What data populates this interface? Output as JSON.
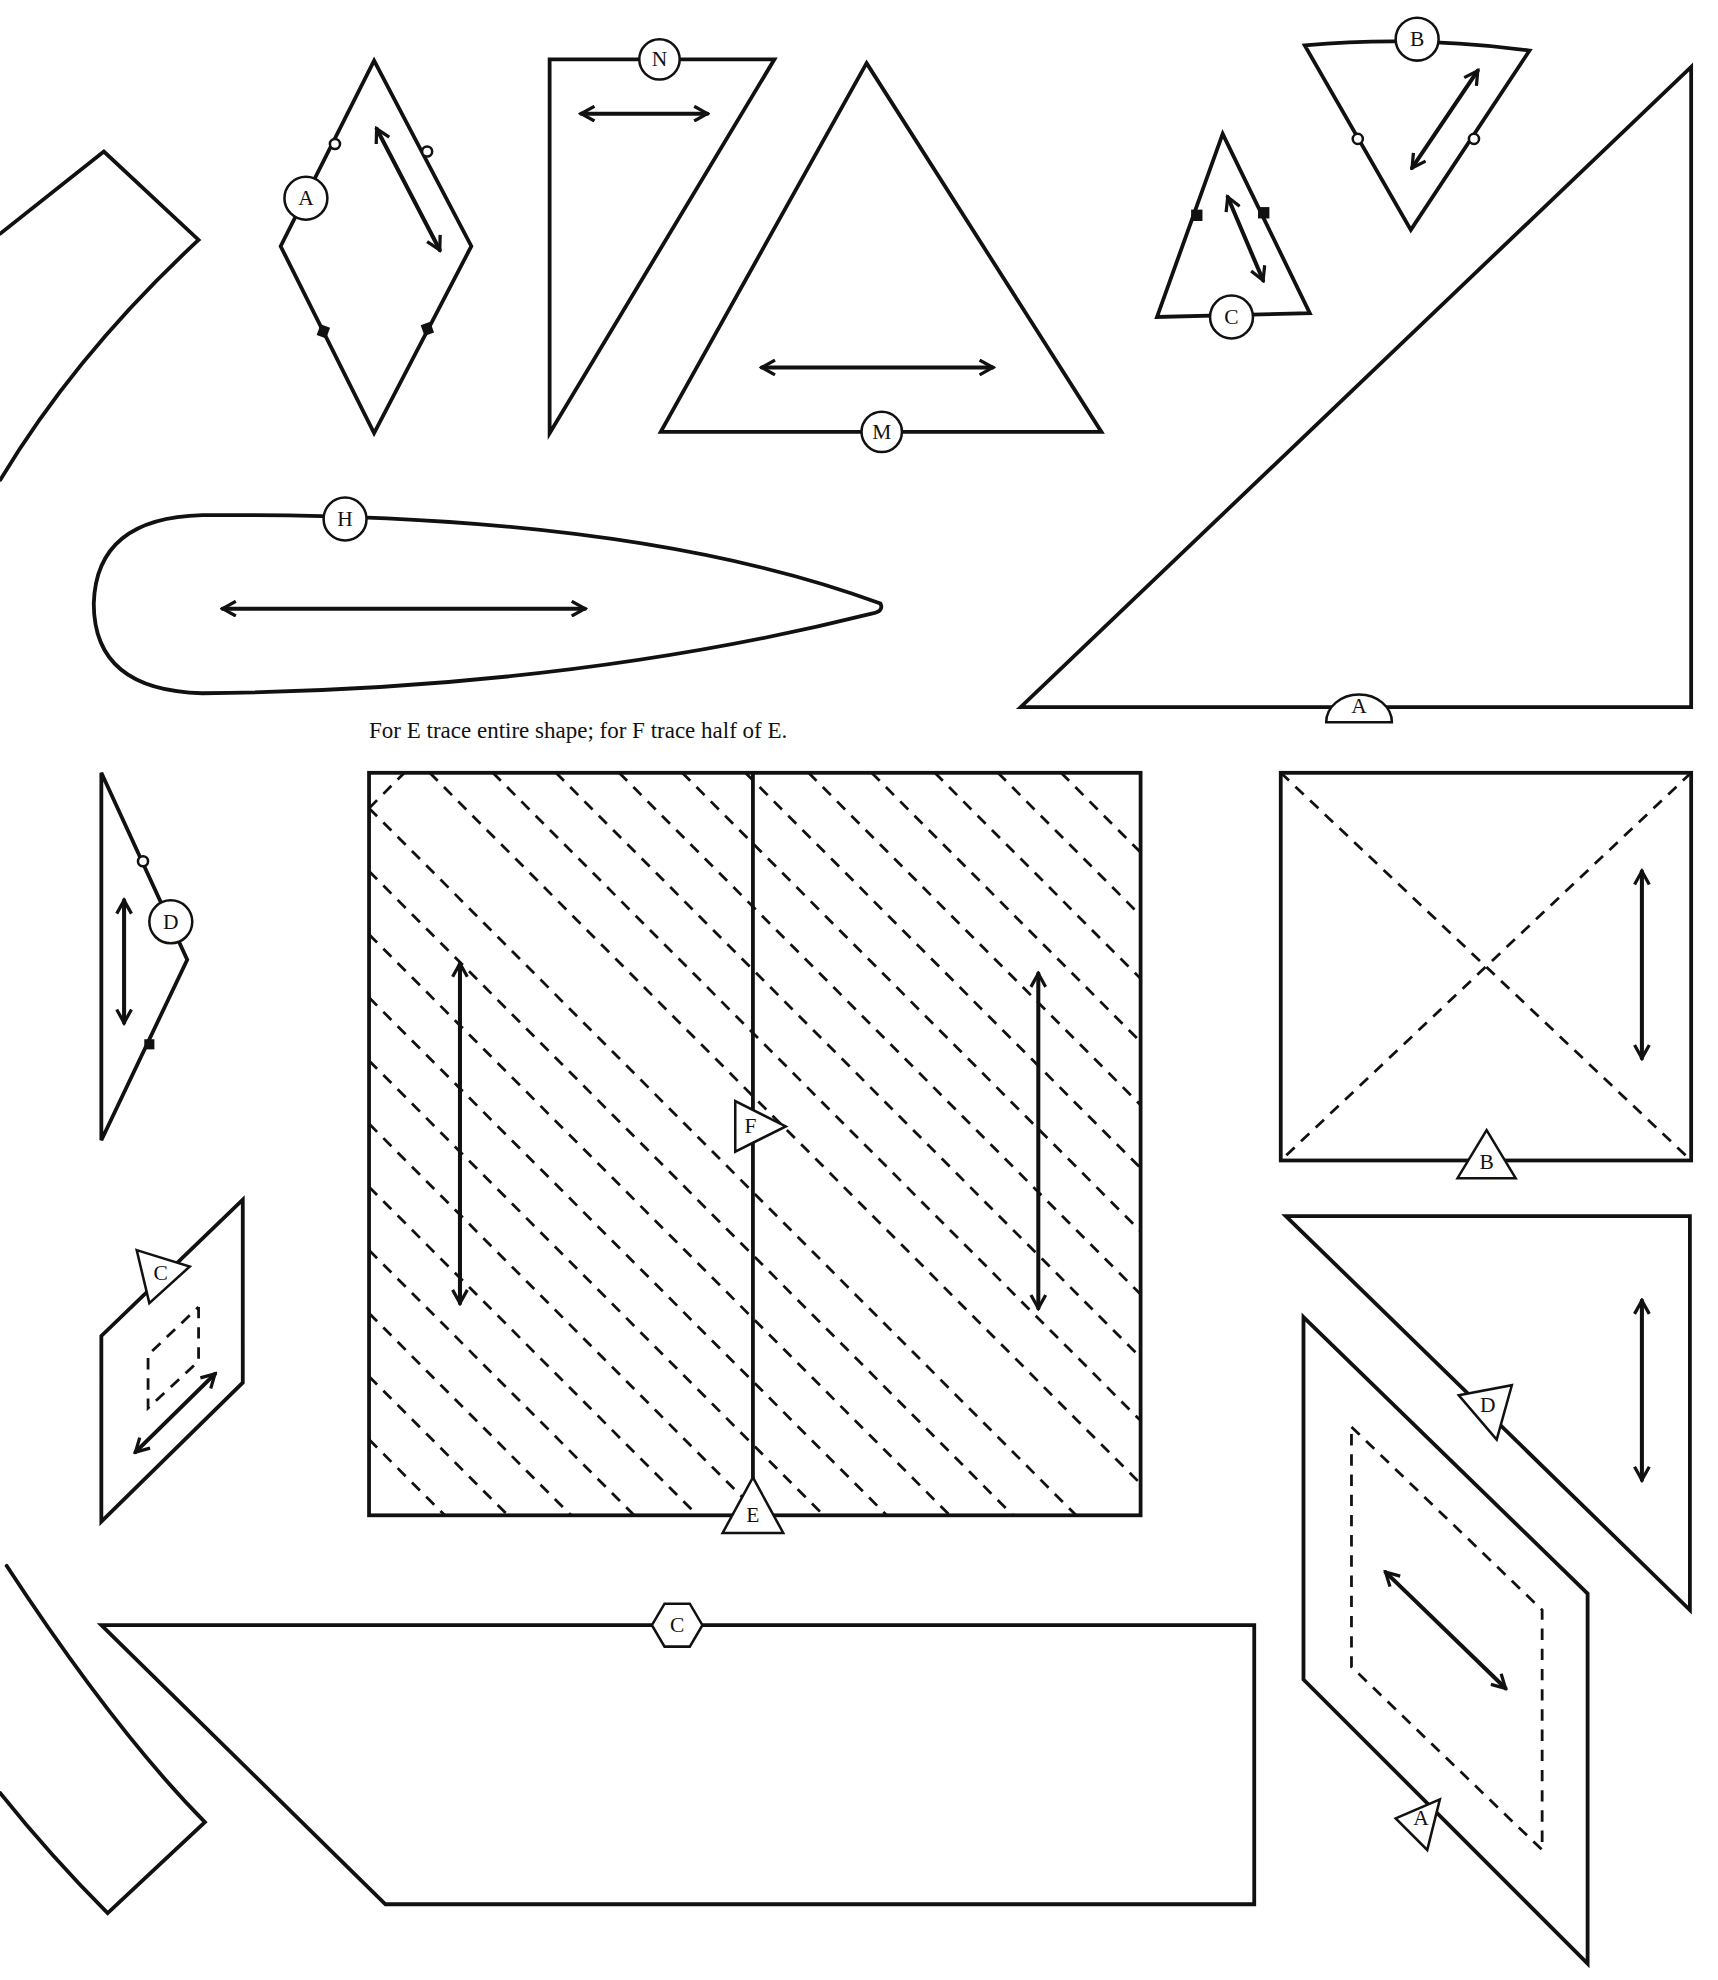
{
  "note": "For E trace entire shape; for F trace half of E.",
  "pieces": [
    {
      "id": "A-diamond",
      "label": "A"
    },
    {
      "id": "N-triangle",
      "label": "N"
    },
    {
      "id": "M-triangle",
      "label": "M"
    },
    {
      "id": "C-small-triangle",
      "label": "C"
    },
    {
      "id": "B-triangle",
      "label": "B"
    },
    {
      "id": "A-large-triangle",
      "label": "A"
    },
    {
      "id": "H-teardrop",
      "label": "H"
    },
    {
      "id": "D-strip",
      "label": "D"
    },
    {
      "id": "E-square",
      "label": "E"
    },
    {
      "id": "F-half",
      "label": "F"
    },
    {
      "id": "B-square",
      "label": "B"
    },
    {
      "id": "D-triangle",
      "label": "D"
    },
    {
      "id": "A-parallelogram",
      "label": "A"
    },
    {
      "id": "C-parallelogram",
      "label": "C"
    },
    {
      "id": "C-trapezoid",
      "label": "C"
    }
  ],
  "colors": {
    "line": "#111111",
    "background": "#ffffff"
  }
}
